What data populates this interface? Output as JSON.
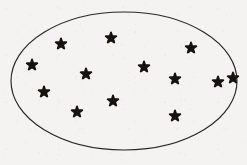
{
  "figure": {
    "name": "stars-scattered-in-ellipse",
    "star_count": 13,
    "background_color": "#f4f3f1",
    "outline_color": "#2a2724",
    "star_color": "#16130f",
    "caption": ""
  },
  "boundary": {
    "shape": "ellipse",
    "center_x": 124,
    "center_y": 81,
    "radius_x": 113,
    "radius_y": 69,
    "stroke_width": 1.15,
    "fill": "none"
  },
  "chart_data": {
    "type": "scatter",
    "title": "",
    "xlabel": "",
    "ylabel": "",
    "xlim": [
      0,
      247
    ],
    "ylim": [
      0,
      165
    ],
    "grid": false,
    "legend": null,
    "marker": "star",
    "marker_size": 11,
    "series": [
      {
        "name": "stars",
        "color": "#16130f",
        "points": [
          {
            "id": "star-01",
            "x": 61,
            "y": 44,
            "size": 11
          },
          {
            "id": "star-02",
            "x": 111,
            "y": 38,
            "size": 11
          },
          {
            "id": "star-03",
            "x": 32,
            "y": 65,
            "size": 11
          },
          {
            "id": "star-04",
            "x": 191,
            "y": 48,
            "size": 11
          },
          {
            "id": "star-05",
            "x": 86,
            "y": 74,
            "size": 11
          },
          {
            "id": "star-06",
            "x": 144,
            "y": 67,
            "size": 11
          },
          {
            "id": "star-07",
            "x": 175,
            "y": 79,
            "size": 11
          },
          {
            "id": "star-08",
            "x": 218,
            "y": 82,
            "size": 11
          },
          {
            "id": "star-09",
            "x": 44,
            "y": 92,
            "size": 11
          },
          {
            "id": "star-10",
            "x": 113,
            "y": 101,
            "size": 11
          },
          {
            "id": "star-11",
            "x": 77,
            "y": 112,
            "size": 11
          },
          {
            "id": "star-12",
            "x": 175,
            "y": 116,
            "size": 11
          },
          {
            "id": "star-13",
            "x": 233,
            "y": 78,
            "size": 11
          }
        ]
      }
    ]
  }
}
